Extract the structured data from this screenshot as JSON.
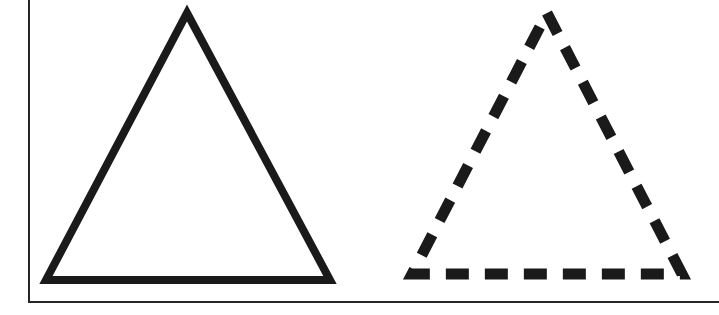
{
  "figure": {
    "title": "Two triangles: solid outline and dashed outline",
    "canvas": {
      "width": 719,
      "height": 315,
      "background_color": "#ffffff"
    },
    "ink_color": "#1a1a1a",
    "frame": {
      "description": "Partial rectangular frame drawn as a left vertical rule and a bottom horizontal rule",
      "stroke_color": "#262626",
      "stroke_width": 2,
      "left_rule": {
        "x": 29,
        "y_top": 0,
        "y_bottom": 303
      },
      "bottom_rule": {
        "y": 302,
        "x_left": 29,
        "x_right": 719
      }
    },
    "shapes": [
      {
        "name": "solid-triangle",
        "label": "Solid outlined triangle",
        "kind": "triangle",
        "line_style": "solid",
        "stroke_color": "#1a1a1a",
        "stroke_width": 8,
        "fill": "none",
        "apex": {
          "x": 187,
          "y": 13
        },
        "bottom_left": {
          "x": 46,
          "y": 280
        },
        "bottom_right": {
          "x": 330,
          "y": 280
        },
        "base_width": 284,
        "height": 267
      },
      {
        "name": "dashed-triangle",
        "label": "Dashed outlined triangle",
        "kind": "triangle",
        "line_style": "dashed",
        "stroke_color": "#1a1a1a",
        "stroke_width": 11,
        "fill": "none",
        "dash_length": 23,
        "gap_length": 16,
        "apex": {
          "x": 547,
          "y": 13
        },
        "bottom_left": {
          "x": 412,
          "y": 274
        },
        "bottom_right": {
          "x": 682,
          "y": 274
        },
        "base_width": 270,
        "height": 261
      }
    ]
  }
}
